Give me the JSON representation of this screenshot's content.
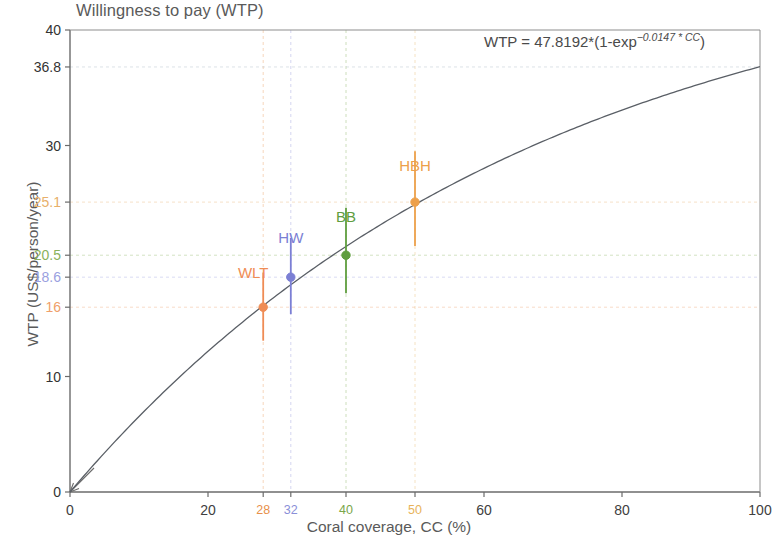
{
  "chart_data": {
    "type": "line",
    "title": "Willingness to pay (WTP)",
    "xlabel": "Coral coverage, CC (%)",
    "ylabel": "WTP (US$/person/year)",
    "annotation": {
      "prefix": "WTP = 47.8192*(1-exp",
      "exponent": "−0.0147 * CC",
      "suffix": ")",
      "full": "WTP = 47.8192*(1-exp^(-0.0147*CC))",
      "coefficient": 47.8192,
      "rate": 0.0147
    },
    "xlim": [
      0,
      100
    ],
    "ylim": [
      0,
      40
    ],
    "grid": "dashed-light",
    "legend": "none",
    "curve": {
      "formula": "47.8192*(1-exp(-0.0147*x))",
      "x_start": 0,
      "x_end": 100,
      "y_at_100": 36.8
    },
    "xticks": [
      {
        "value": 0,
        "label": "0",
        "color": "#404040"
      },
      {
        "value": 20,
        "label": "20",
        "color": "#404040"
      },
      {
        "value": 28,
        "label": "28",
        "color": "#e8904a"
      },
      {
        "value": 32,
        "label": "32",
        "color": "#8a8fd8"
      },
      {
        "value": 40,
        "label": "40",
        "color": "#7aa64a"
      },
      {
        "value": 50,
        "label": "50",
        "color": "#e8b35a"
      },
      {
        "value": 60,
        "label": "60",
        "color": "#404040"
      },
      {
        "value": 80,
        "label": "80",
        "color": "#404040"
      },
      {
        "value": 100,
        "label": "100",
        "color": "#404040"
      }
    ],
    "yticks": [
      {
        "value": 0,
        "label": "0",
        "color": "#333333"
      },
      {
        "value": 10,
        "label": "10",
        "color": "#333333"
      },
      {
        "value": 16,
        "label": "16",
        "color": "#efa06a"
      },
      {
        "value": 18.6,
        "label": "18.6",
        "color": "#9aa0e0"
      },
      {
        "value": 20.5,
        "label": "20.5",
        "color": "#8ab25c"
      },
      {
        "value": 25.1,
        "label": "25.1",
        "color": "#e8b06a"
      },
      {
        "value": 30,
        "label": "30",
        "color": "#333333"
      },
      {
        "value": 36.8,
        "label": "36.8",
        "color": "#333333"
      },
      {
        "value": 40,
        "label": "40",
        "color": "#333333"
      }
    ],
    "points": [
      {
        "name": "WLT",
        "x": 28,
        "y": 16.0,
        "y_low": 13.1,
        "y_high": 19.0,
        "color": "#ef8c55"
      },
      {
        "name": "HW",
        "x": 32,
        "y": 18.6,
        "y_low": 15.4,
        "y_high": 22.0,
        "color": "#7b7fd4"
      },
      {
        "name": "BB",
        "x": 40,
        "y": 20.5,
        "y_low": 17.2,
        "y_high": 24.6,
        "color": "#5f9e3f"
      },
      {
        "name": "HBH",
        "x": 50,
        "y": 25.1,
        "y_low": 21.3,
        "y_high": 29.5,
        "color": "#eda04a"
      }
    ],
    "point_label_offsets": [
      {
        "name": "WLT",
        "dy": -42
      },
      {
        "name": "HW",
        "dy": -47
      },
      {
        "name": "BB",
        "dy": -46
      },
      {
        "name": "HBH",
        "dy": -44
      }
    ]
  }
}
